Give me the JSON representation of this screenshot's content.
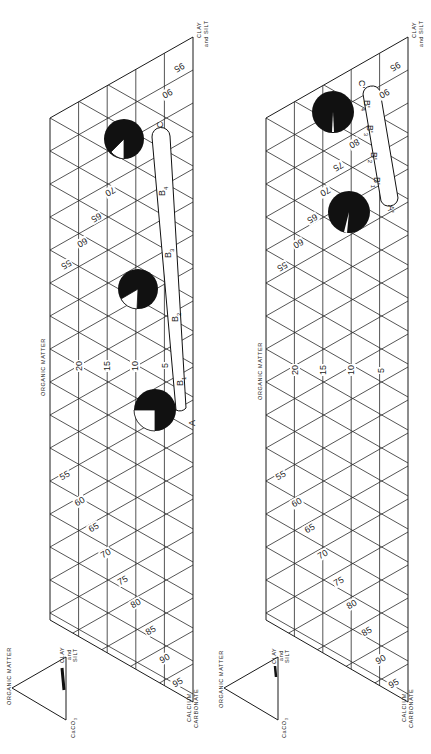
{
  "figure": {
    "orientation": "rotated 90 degrees clockwise",
    "panels": [
      {
        "id": "upper",
        "axis_labels": {
          "top_vertex": "CLAY and SILT",
          "bottom_vertex": "CALCIUM CARBONATE",
          "side": "ORGANIC MATTER"
        },
        "organic_matter_ticks": [
          "5",
          "10",
          "15",
          "20"
        ],
        "clay_silt_ticks": [
          "55",
          "60",
          "65",
          "70",
          "75",
          "80",
          "85",
          "90",
          "95"
        ],
        "upper_ticks": [
          "55",
          "60",
          "65",
          "70",
          "90",
          "95"
        ],
        "profile_path": {
          "start_label": "A",
          "end_label": "C",
          "horizon_labels": [
            "B1",
            "B2",
            "B3",
            "B4"
          ]
        },
        "pie_markers": [
          {
            "position": "near A",
            "white_fraction": 0.22
          },
          {
            "position": "middle",
            "white_fraction": 0.15
          },
          {
            "position": "near C",
            "white_fraction": 0.12
          }
        ],
        "inset": {
          "title": "ORGANIC MATTER",
          "vertex_right": "CLAY and SILT",
          "vertex_bottom": "CaCO3"
        }
      },
      {
        "id": "lower",
        "axis_labels": {
          "top_vertex": "CLAY and SILT",
          "bottom_vertex": "CALCIUM CARBONATE",
          "side": "ORGANIC MATTER"
        },
        "organic_matter_ticks": [
          "5",
          "10",
          "15",
          "20"
        ],
        "clay_silt_ticks": [
          "55",
          "60",
          "65",
          "70",
          "75",
          "80",
          "85",
          "90",
          "95"
        ],
        "upper_ticks": [
          "55",
          "60",
          "65",
          "70",
          "75",
          "80",
          "90",
          "95"
        ],
        "profile_path": {
          "start_label": "A'",
          "end_label": "C'",
          "horizon_labels": [
            "B'1",
            "B'2",
            "B'3",
            "B'4"
          ]
        },
        "pie_markers": [
          {
            "position": "near A'",
            "white_fraction": 0.05
          },
          {
            "position": "near C'",
            "white_fraction": 0.02
          }
        ],
        "inset": {
          "title": "ORGANIC MATTER",
          "vertex_right": "CLAY and SILT",
          "vertex_bottom": "CaCO3"
        }
      }
    ]
  },
  "labels": {
    "clay": "CLAY",
    "and_silt": "and SILT",
    "and": "and",
    "silt": "SILT",
    "calcium": "CALCIUM",
    "carbonate": "CARBONATE",
    "organic_matter": "ORGANIC MATTER",
    "caco3": "CaCO",
    "caco3_sub": "3",
    "A": "A",
    "C": "C",
    "B": "B",
    "sub1": "1",
    "sub2": "2",
    "sub3": "3",
    "sub4": "4",
    "Ap": "A'",
    "Cp": "C'",
    "Bp": "B'"
  },
  "ticks": {
    "t5": "5",
    "t10": "10",
    "t15": "15",
    "t20": "20",
    "t55": "55",
    "t60": "60",
    "t65": "65",
    "t70": "70",
    "t75": "75",
    "t80": "80",
    "t85": "85",
    "t90": "90",
    "t95": "95"
  }
}
